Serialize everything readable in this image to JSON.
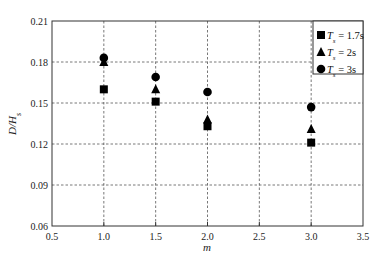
{
  "chart_data": {
    "type": "scatter",
    "title": "",
    "xlabel": "m",
    "ylabel": "D/H_s",
    "ylabel_main": "D/H",
    "ylabel_sub": "s",
    "xlim": [
      0.5,
      3.5
    ],
    "ylim": [
      0.06,
      0.21
    ],
    "xticks": [
      "0.5",
      "1.0",
      "1.5",
      "2.0",
      "2.5",
      "3.0",
      "3.5"
    ],
    "yticks": [
      "0.06",
      "0.09",
      "0.12",
      "0.15",
      "0.18",
      "0.21"
    ],
    "grid": "dashed, at tick positions",
    "legend_position": "upper right",
    "x": [
      1.0,
      1.5,
      2.0,
      3.0
    ],
    "series": [
      {
        "name": "T_s = 1.7s",
        "label_main": "T",
        "label_sub": "s",
        "label_rest": " = 1.7s",
        "marker": "square",
        "values": [
          0.16,
          0.151,
          0.133,
          0.121
        ]
      },
      {
        "name": "T_s = 2s",
        "label_main": "T",
        "label_sub": "s",
        "label_rest": " = 2s",
        "marker": "triangle",
        "values": [
          0.18,
          0.16,
          0.138,
          0.131
        ]
      },
      {
        "name": "T_s = 3s",
        "label_main": "T",
        "label_sub": "s",
        "label_rest": " = 3s",
        "marker": "circle",
        "values": [
          0.183,
          0.169,
          0.158,
          0.147
        ]
      }
    ]
  },
  "colors": {
    "marker": "#000000",
    "axis": "#333333",
    "grid": "#555555"
  }
}
